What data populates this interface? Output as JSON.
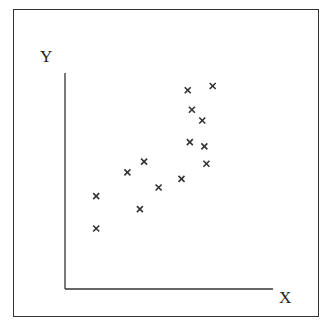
{
  "chart_data": {
    "type": "scatter",
    "title": "",
    "xlabel": "X",
    "ylabel": "Y",
    "grid": false,
    "legend": null,
    "marker": "x",
    "marker_color": "#333333",
    "axis_color": "#333333",
    "note": "Unlabeled axes; values given in relative units (0-100) estimated from pixel positions. Shows positive correlation.",
    "xlim": [
      0,
      100
    ],
    "ylim": [
      0,
      100
    ],
    "points": [
      {
        "x": 15,
        "y": 43
      },
      {
        "x": 15,
        "y": 28
      },
      {
        "x": 30,
        "y": 54
      },
      {
        "x": 38,
        "y": 59
      },
      {
        "x": 36,
        "y": 37
      },
      {
        "x": 45,
        "y": 47
      },
      {
        "x": 56,
        "y": 51
      },
      {
        "x": 59,
        "y": 92
      },
      {
        "x": 60,
        "y": 68
      },
      {
        "x": 61,
        "y": 83
      },
      {
        "x": 66,
        "y": 78
      },
      {
        "x": 67,
        "y": 66
      },
      {
        "x": 68,
        "y": 58
      },
      {
        "x": 71,
        "y": 94
      }
    ]
  },
  "axes": {
    "x_label": "X",
    "y_label": "Y"
  }
}
